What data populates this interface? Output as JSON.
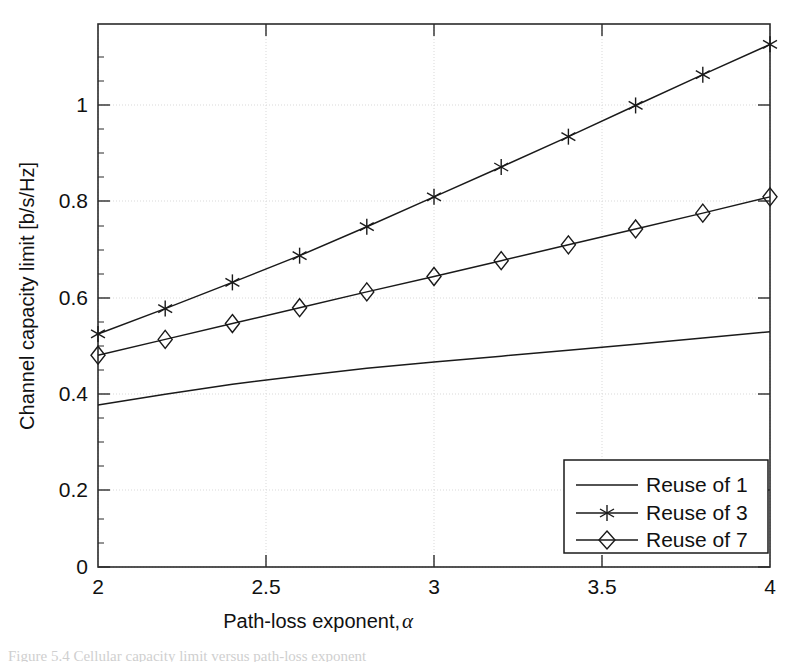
{
  "chart_data": {
    "type": "line",
    "title": "",
    "xlabel": "Path-loss exponent, α",
    "ylabel": "Channel capacity limit [b/s/Hz]",
    "xlim": [
      2,
      4
    ],
    "ylim": [
      0,
      1.2
    ],
    "xticks": [
      "2",
      "2.5",
      "3",
      "3.5",
      "4"
    ],
    "xtick_values": [
      2,
      2.5,
      3,
      3.5,
      4
    ],
    "yticks": [
      "0",
      "0.2",
      "0.4",
      "0.6",
      "0.8",
      "1"
    ],
    "ytick_values": [
      0,
      0.2,
      0.4,
      0.6,
      0.8,
      1
    ],
    "grid": true,
    "legend_position": "lower right",
    "x": [
      2,
      2.2,
      2.4,
      2.6,
      2.8,
      3,
      3.2,
      3.4,
      3.6,
      3.8,
      4
    ],
    "series": [
      {
        "name": "Reuse of 1",
        "marker": "none",
        "values": [
          0.358,
          0.382,
          0.404,
          0.422,
          0.439,
          0.453,
          0.466,
          0.479,
          0.492,
          0.506,
          0.52
        ]
      },
      {
        "name": "Reuse of 3",
        "marker": "asterisk",
        "values": [
          0.515,
          0.571,
          0.629,
          0.688,
          0.752,
          0.818,
          0.884,
          0.951,
          1.02,
          1.088,
          1.155
        ]
      },
      {
        "name": "Reuse of 7",
        "marker": "diamond",
        "values": [
          0.468,
          0.503,
          0.538,
          0.573,
          0.608,
          0.642,
          0.677,
          0.712,
          0.747,
          0.782,
          0.818
        ]
      }
    ]
  },
  "axes": {
    "x_label": "Path-loss exponent, ",
    "x_label_symbol": "α",
    "y_label": "Channel capacity limit [b/s/Hz]"
  },
  "legend": {
    "entries": [
      {
        "label": "Reuse of 1"
      },
      {
        "label": "Reuse of 3"
      },
      {
        "label": "Reuse of 7"
      }
    ]
  },
  "colors": {
    "axis": "#2b2b2b",
    "grid": "#d9d9d9",
    "series": "#1a1a1a",
    "background": "#ffffff"
  },
  "caption": {
    "text": "Figure 5.4  Cellular capacity limit versus path-loss exponent"
  }
}
